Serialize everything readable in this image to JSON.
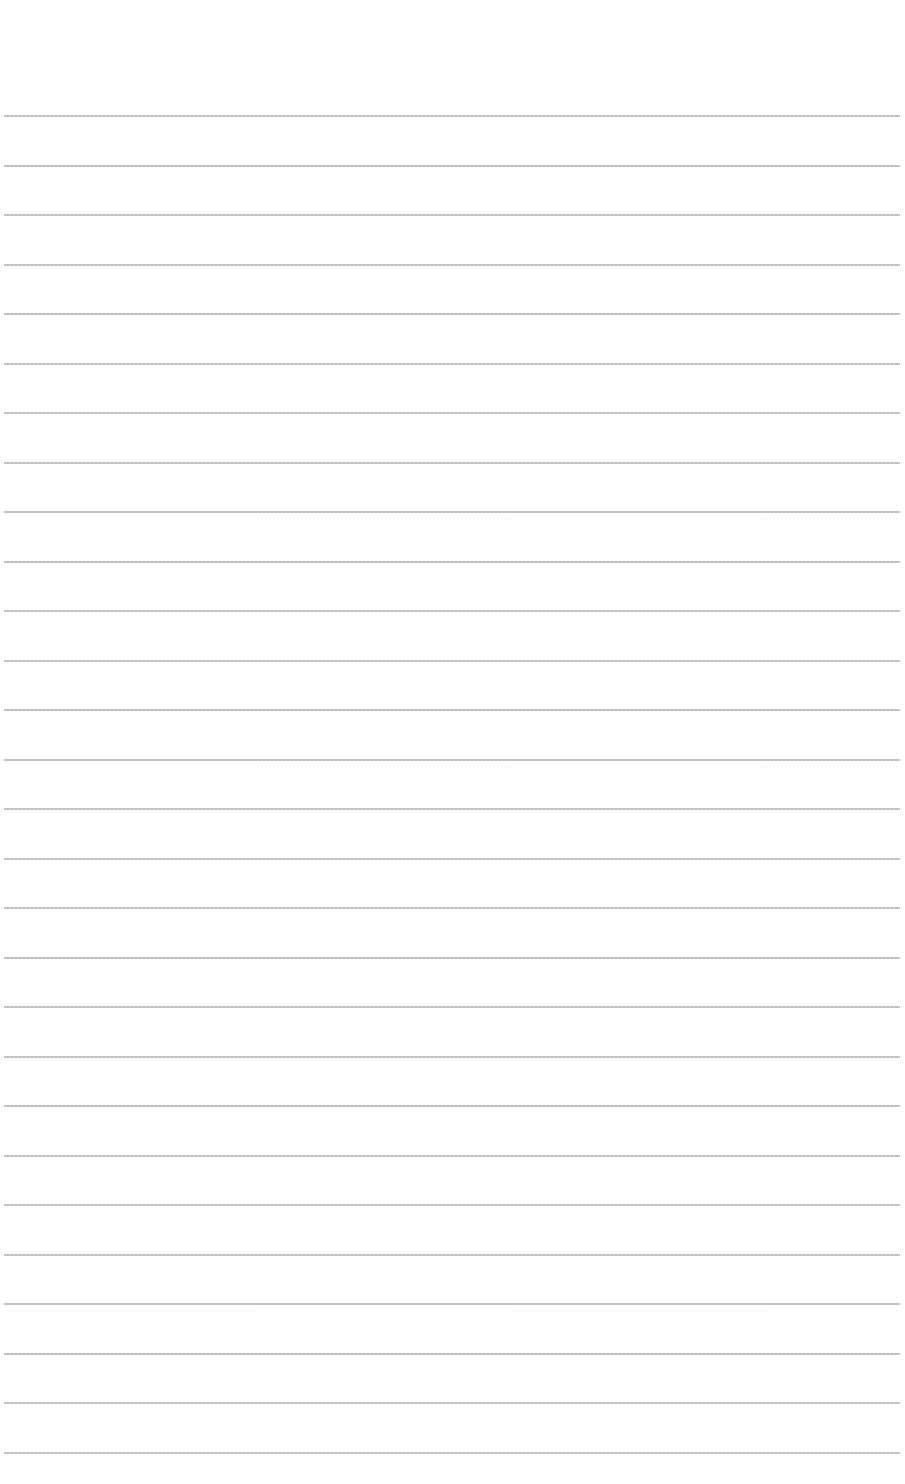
{
  "document": {
    "type": "lined-paper",
    "line_count": 28,
    "first_line_y": 115,
    "line_spacing": 49.5,
    "line_color": "#b0b0b0",
    "background_color": "#fefefe",
    "text": []
  }
}
